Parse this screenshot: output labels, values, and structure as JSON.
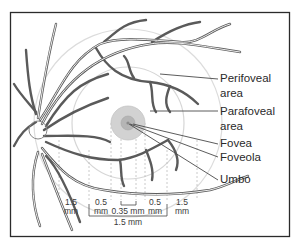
{
  "figure": {
    "labels": [
      {
        "id": "perifoveal",
        "line1": "Perifoveal",
        "line2": "area"
      },
      {
        "id": "parafoveal",
        "line1": "Parafoveal",
        "line2": "area"
      },
      {
        "id": "fovea",
        "line1": "Fovea"
      },
      {
        "id": "foveola",
        "line1": "Foveola"
      },
      {
        "id": "umbo",
        "line1": "Umbo"
      }
    ],
    "measurements": {
      "left_outer": {
        "value": "1.5",
        "unit": "mm"
      },
      "left_inner": {
        "value": "0.5",
        "unit": "mm"
      },
      "center": "0.35 mm",
      "right_inner": {
        "value": "0.5",
        "unit": "mm"
      },
      "right_outer": {
        "value": "1.5",
        "unit": "mm"
      },
      "fovea_width": "1.5 mm"
    },
    "colors": {
      "frame": "#2b2b2b",
      "vessel": "#555555",
      "ring": "#d9d9d9",
      "fovea_fill": "#cfcfcf",
      "foveola_fill": "#b4b4b4",
      "leader": "#4a4a4a"
    }
  }
}
